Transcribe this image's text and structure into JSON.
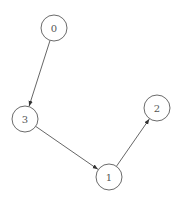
{
  "diagram": {
    "type": "directed-graph",
    "nodes": [
      {
        "id": "0",
        "label": "0",
        "x": 54,
        "y": 28
      },
      {
        "id": "1",
        "label": "1",
        "x": 109,
        "y": 177
      },
      {
        "id": "2",
        "label": "2",
        "x": 157,
        "y": 108
      },
      {
        "id": "3",
        "label": "3",
        "x": 25,
        "y": 119
      }
    ],
    "edges": [
      {
        "from": "0",
        "to": "3"
      },
      {
        "from": "3",
        "to": "1"
      },
      {
        "from": "1",
        "to": "2"
      }
    ],
    "node_radius": 13,
    "colors": {
      "stroke": "#6b6b6b",
      "edge": "#555555",
      "text": "#555555",
      "background": "#ffffff"
    }
  }
}
